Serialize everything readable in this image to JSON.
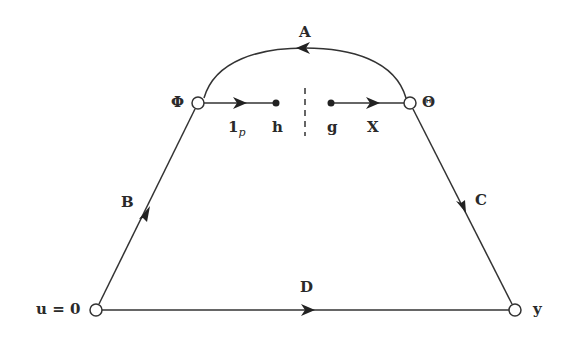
{
  "diagram": {
    "type": "signal-flow-graph",
    "nodes": [
      {
        "id": "u",
        "label": "u = 0",
        "x": 96,
        "y": 310,
        "kind": "open"
      },
      {
        "id": "Phi",
        "label": "Φ",
        "x": 198,
        "y": 103,
        "kind": "open"
      },
      {
        "id": "h",
        "label": "h",
        "x": 276,
        "y": 103,
        "kind": "filled"
      },
      {
        "id": "g",
        "label": "g",
        "x": 331,
        "y": 103,
        "kind": "filled"
      },
      {
        "id": "Theta",
        "label": "Θ",
        "x": 410,
        "y": 103,
        "kind": "open"
      },
      {
        "id": "y",
        "label": "y",
        "x": 515,
        "y": 310,
        "kind": "open"
      }
    ],
    "edges": [
      {
        "id": "A",
        "label": "A",
        "from": "Theta",
        "to": "Phi",
        "shape": "arc"
      },
      {
        "id": "B",
        "label": "B",
        "from": "u",
        "to": "Phi"
      },
      {
        "id": "C",
        "label": "C",
        "from": "Theta",
        "to": "y"
      },
      {
        "id": "D",
        "label": "D",
        "from": "u",
        "to": "y"
      },
      {
        "id": "1p",
        "label_main": "1",
        "label_sub": "p",
        "from": "Phi",
        "to": "h"
      },
      {
        "id": "X",
        "label": "X",
        "from": "g",
        "to": "Theta"
      }
    ],
    "break_line": {
      "x": 305,
      "y1": 88,
      "y2": 135,
      "style": "dashed"
    }
  },
  "labels": {
    "A": "A",
    "B": "B",
    "C": "C",
    "D": "D",
    "X": "X",
    "one_p_main": "1",
    "one_p_sub": "p",
    "h": "h",
    "g": "g",
    "Phi": "Φ",
    "Theta": "Θ",
    "u0": "u = 0",
    "y": "y"
  }
}
